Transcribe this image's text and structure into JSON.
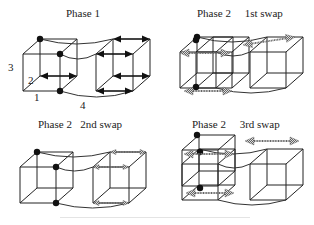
{
  "panels": [
    {
      "id": "phase1",
      "title": "Phase 1",
      "arrow_style": "solid"
    },
    {
      "id": "phase2-swap1",
      "title": "Phase 2     1st swap",
      "arrow_style": "hatched"
    },
    {
      "id": "phase2-swap2",
      "title": "Phase 2   2nd swap",
      "arrow_style": "hatched-small"
    },
    {
      "id": "phase2-swap3",
      "title": "Phase 2     3rd swap",
      "arrow_style": "hatched"
    }
  ],
  "axis_labels": {
    "dim1": "1",
    "dim2": "2",
    "dim3": "3",
    "dim4": "4"
  },
  "colors": {
    "line": "#222222",
    "node": "#111111",
    "hatched_arrow": "#777777"
  }
}
